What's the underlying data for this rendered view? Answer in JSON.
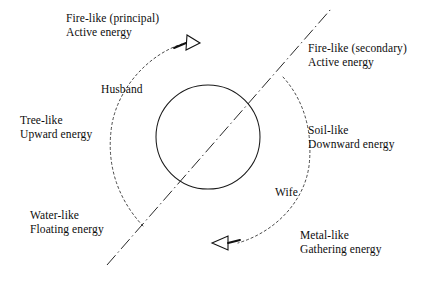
{
  "diagram": {
    "colors": {
      "ink": "#0d0d0d",
      "stroke": "#1a1a1a",
      "background": "#ffffff"
    },
    "labels": {
      "fire_principal": {
        "line1": "Fire-like (principal)",
        "line2": "Active energy"
      },
      "fire_secondary": {
        "line1": "Fire-like (secondary)",
        "line2": "Active energy"
      },
      "tree": {
        "line1": "Tree-like",
        "line2": "Upward energy"
      },
      "soil": {
        "line1": "Soil-like",
        "line2": "Downward energy"
      },
      "water": {
        "line1": "Water-like",
        "line2": "Floating energy"
      },
      "metal": {
        "line1": "Metal-like",
        "line2": "Gathering energy"
      },
      "husband": {
        "line1": "Husband"
      },
      "wife": {
        "line1": "Wife"
      }
    },
    "shapes": {
      "circle": {
        "name": "center-circle",
        "cx": 208,
        "cy": 137,
        "r": 52
      },
      "axis_line": {
        "name": "dash-dot-axis",
        "x1": 107,
        "y1": 265,
        "x2": 331,
        "y2": 9
      },
      "husband_arc": {
        "name": "husband-dashed-arc",
        "from_x": 143,
        "from_y": 226,
        "to_x": 184,
        "to_y": 45
      },
      "wife_arc": {
        "name": "wife-dashed-arc",
        "from_x": 283,
        "from_y": 77,
        "to_x": 236,
        "to_y": 244
      },
      "husband_arrow": {
        "name": "husband-arrowhead",
        "x": 193,
        "y": 42,
        "direction": "up-right"
      },
      "wife_arrow": {
        "name": "wife-arrowhead",
        "x": 220,
        "y": 242,
        "direction": "down-left"
      }
    }
  }
}
